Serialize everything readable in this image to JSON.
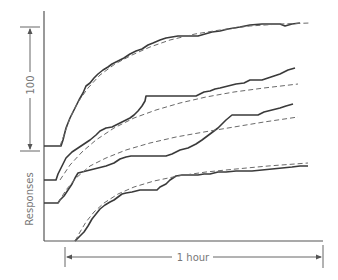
{
  "chart_data": {
    "type": "line",
    "title": "",
    "xlabel": "1 hour",
    "ylabel": "Responses",
    "scale_bar": {
      "label": "100",
      "orientation": "vertical",
      "units": "responses"
    },
    "time_bar": {
      "label": "1 hour",
      "orientation": "horizontal"
    },
    "grid": false,
    "legend": null,
    "note": "Four cumulative response records (solid) with fitted smooth curves (dashed), vertically offset; coordinates in pixel space",
    "series": [
      {
        "name": "record-1",
        "style": "solid",
        "points": [
          [
            44,
            146
          ],
          [
            61,
            146
          ],
          [
            63,
            140
          ],
          [
            66,
            128
          ],
          [
            70,
            118
          ],
          [
            74,
            110
          ],
          [
            79,
            100
          ],
          [
            83,
            93
          ],
          [
            86,
            86
          ],
          [
            90,
            83
          ],
          [
            94,
            78
          ],
          [
            98,
            74
          ],
          [
            103,
            70
          ],
          [
            108,
            67
          ],
          [
            112,
            64
          ],
          [
            118,
            61
          ],
          [
            124,
            58
          ],
          [
            130,
            54
          ],
          [
            136,
            51
          ],
          [
            142,
            49
          ],
          [
            148,
            45
          ],
          [
            153,
            43
          ],
          [
            160,
            40
          ],
          [
            166,
            38
          ],
          [
            172,
            37
          ],
          [
            178,
            36
          ],
          [
            198,
            36
          ],
          [
            205,
            34
          ],
          [
            212,
            32
          ],
          [
            220,
            31
          ],
          [
            228,
            29
          ],
          [
            240,
            27
          ],
          [
            250,
            25
          ],
          [
            262,
            24
          ],
          [
            280,
            24
          ],
          [
            285,
            26
          ],
          [
            292,
            24
          ],
          [
            300,
            23
          ]
        ]
      },
      {
        "name": "fit-1",
        "style": "dashed",
        "points": [
          [
            60,
            146
          ],
          [
            64,
            135
          ],
          [
            70,
            118
          ],
          [
            78,
            102
          ],
          [
            88,
            88
          ],
          [
            100,
            75
          ],
          [
            115,
            64
          ],
          [
            132,
            55
          ],
          [
            150,
            47
          ],
          [
            170,
            40
          ],
          [
            195,
            34
          ],
          [
            220,
            30
          ],
          [
            250,
            26
          ],
          [
            280,
            24
          ],
          [
            310,
            23
          ]
        ]
      },
      {
        "name": "record-2",
        "style": "solid",
        "points": [
          [
            44,
            180
          ],
          [
            56,
            180
          ],
          [
            58,
            174
          ],
          [
            62,
            166
          ],
          [
            66,
            158
          ],
          [
            72,
            152
          ],
          [
            78,
            148
          ],
          [
            84,
            144
          ],
          [
            90,
            140
          ],
          [
            96,
            135
          ],
          [
            100,
            131
          ],
          [
            106,
            128
          ],
          [
            112,
            127
          ],
          [
            118,
            124
          ],
          [
            124,
            121
          ],
          [
            130,
            118
          ],
          [
            134,
            115
          ],
          [
            138,
            111
          ],
          [
            142,
            106
          ],
          [
            145,
            101
          ],
          [
            146,
            96
          ],
          [
            160,
            96
          ],
          [
            180,
            96
          ],
          [
            196,
            96
          ],
          [
            200,
            94
          ],
          [
            204,
            92
          ],
          [
            210,
            91
          ],
          [
            215,
            89
          ],
          [
            220,
            88
          ],
          [
            228,
            86
          ],
          [
            236,
            84
          ],
          [
            244,
            83
          ],
          [
            250,
            80
          ],
          [
            262,
            80
          ],
          [
            268,
            78
          ],
          [
            274,
            76
          ],
          [
            280,
            74
          ],
          [
            288,
            70
          ],
          [
            295,
            68
          ]
        ]
      },
      {
        "name": "fit-2",
        "style": "dashed",
        "points": [
          [
            60,
            180
          ],
          [
            70,
            165
          ],
          [
            82,
            152
          ],
          [
            96,
            140
          ],
          [
            114,
            128
          ],
          [
            134,
            118
          ],
          [
            156,
            110
          ],
          [
            180,
            103
          ],
          [
            206,
            97
          ],
          [
            234,
            92
          ],
          [
            264,
            88
          ],
          [
            298,
            84
          ]
        ]
      },
      {
        "name": "record-3",
        "style": "solid",
        "points": [
          [
            44,
            203
          ],
          [
            58,
            203
          ],
          [
            60,
            200
          ],
          [
            64,
            196
          ],
          [
            68,
            190
          ],
          [
            72,
            184
          ],
          [
            75,
            178
          ],
          [
            78,
            173
          ],
          [
            82,
            172
          ],
          [
            90,
            170
          ],
          [
            98,
            168
          ],
          [
            106,
            166
          ],
          [
            114,
            163
          ],
          [
            120,
            159
          ],
          [
            126,
            157
          ],
          [
            131,
            156
          ],
          [
            150,
            156
          ],
          [
            160,
            156
          ],
          [
            166,
            156
          ],
          [
            172,
            154
          ],
          [
            180,
            150
          ],
          [
            188,
            148
          ],
          [
            196,
            144
          ],
          [
            202,
            140
          ],
          [
            210,
            134
          ],
          [
            218,
            128
          ],
          [
            226,
            120
          ],
          [
            232,
            115
          ],
          [
            240,
            115
          ],
          [
            250,
            115
          ],
          [
            258,
            115
          ],
          [
            264,
            112
          ],
          [
            272,
            110
          ],
          [
            280,
            108
          ],
          [
            286,
            106
          ],
          [
            293,
            104
          ]
        ]
      },
      {
        "name": "fit-3",
        "style": "dashed",
        "points": [
          [
            58,
            203
          ],
          [
            66,
            190
          ],
          [
            76,
            178
          ],
          [
            90,
            166
          ],
          [
            106,
            158
          ],
          [
            126,
            150
          ],
          [
            150,
            143
          ],
          [
            176,
            137
          ],
          [
            204,
            132
          ],
          [
            234,
            127
          ],
          [
            264,
            122
          ],
          [
            298,
            117
          ]
        ]
      },
      {
        "name": "record-4",
        "style": "solid",
        "points": [
          [
            75,
            241
          ],
          [
            80,
            236
          ],
          [
            84,
            232
          ],
          [
            88,
            226
          ],
          [
            92,
            219
          ],
          [
            96,
            214
          ],
          [
            100,
            209
          ],
          [
            105,
            205
          ],
          [
            110,
            202
          ],
          [
            114,
            200
          ],
          [
            118,
            197
          ],
          [
            122,
            194
          ],
          [
            126,
            193
          ],
          [
            132,
            192
          ],
          [
            140,
            190
          ],
          [
            150,
            190
          ],
          [
            157,
            190
          ],
          [
            160,
            187
          ],
          [
            166,
            184
          ],
          [
            170,
            180
          ],
          [
            176,
            176
          ],
          [
            182,
            175
          ],
          [
            198,
            175
          ],
          [
            204,
            174
          ],
          [
            210,
            174
          ],
          [
            218,
            172
          ],
          [
            226,
            172
          ],
          [
            236,
            171
          ],
          [
            244,
            171
          ],
          [
            252,
            171
          ],
          [
            262,
            170
          ],
          [
            272,
            169
          ],
          [
            282,
            168
          ],
          [
            292,
            167
          ],
          [
            300,
            166
          ],
          [
            308,
            166
          ]
        ]
      },
      {
        "name": "fit-4",
        "style": "dashed",
        "points": [
          [
            75,
            241
          ],
          [
            80,
            232
          ],
          [
            86,
            222
          ],
          [
            94,
            212
          ],
          [
            104,
            203
          ],
          [
            118,
            194
          ],
          [
            134,
            187
          ],
          [
            154,
            181
          ],
          [
            178,
            176
          ],
          [
            206,
            172
          ],
          [
            236,
            169
          ],
          [
            268,
            166
          ],
          [
            308,
            163
          ]
        ]
      }
    ],
    "axes": {
      "y_axis": {
        "x": 44,
        "y_top": 11,
        "y_bottom": 241
      },
      "x_axis": {
        "y": 241,
        "x_left": 44,
        "x_right": 323
      }
    },
    "colors": {
      "record": "#3a3a3a",
      "fit": "#6a6a6a",
      "axis": "#555555",
      "text": "#777777"
    }
  },
  "labels": {
    "scale": "100",
    "y_axis": "Responses",
    "x_time": "1 hour"
  }
}
